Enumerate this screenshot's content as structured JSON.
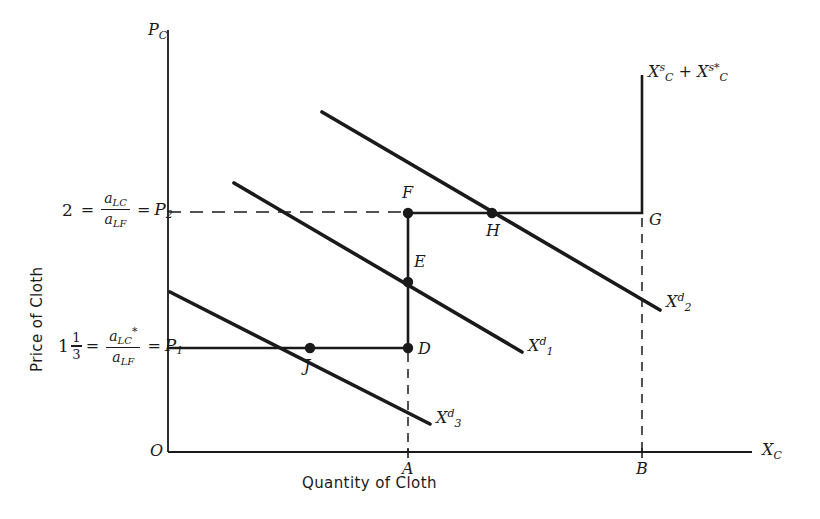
{
  "figure": {
    "background": "#ffffff",
    "ink": "#1a1a1a",
    "width": 820,
    "height": 519
  },
  "axes": {
    "x_axis_title": "Quantity of Cloth",
    "y_axis_title": "Price of Cloth",
    "x_axis_symbol": "X",
    "x_axis_symbol_sub": "C",
    "y_axis_symbol": "P",
    "y_axis_symbol_sub": "C",
    "origin_label": "O",
    "x_ticks": [
      {
        "label": "A",
        "x": 408
      },
      {
        "label": "B",
        "x": 642
      }
    ]
  },
  "price_levels": [
    {
      "id": "P2",
      "value_text": "2",
      "numerator": "a",
      "numerator_sub": "LC",
      "numerator_star": "",
      "denominator": "a",
      "denominator_sub": "LF",
      "price_symbol": "P",
      "price_sub": "2",
      "y": 212
    },
    {
      "id": "P1",
      "value_whole": "1",
      "value_num": "1",
      "value_den": "3",
      "numerator": "a",
      "numerator_sub": "LC",
      "numerator_star": "*",
      "denominator": "a",
      "denominator_sub": "LF",
      "price_symbol": "P",
      "price_sub": "1",
      "y": 348
    }
  ],
  "curves": {
    "supply": {
      "name": "world-supply-curve",
      "symbol_1": "X",
      "symbol_1_sub": "C",
      "symbol_1_sup": "s",
      "plus": "+",
      "symbol_2": "X",
      "symbol_2_sub": "C",
      "symbol_2_sup": "s*",
      "label_x": 648,
      "label_y": 70,
      "points": "168,348 408,348 408,213 642,213 642,75"
    },
    "demand": [
      {
        "id": "X2d",
        "symbol": "X",
        "sub": "2",
        "sup": "d",
        "x1": 322,
        "y1": 112,
        "x2": 660,
        "y2": 310,
        "label_x": 666,
        "label_y": 300
      },
      {
        "id": "X1d",
        "symbol": "X",
        "sub": "1",
        "sup": "d",
        "x1": 234,
        "y1": 183,
        "x2": 522,
        "y2": 352,
        "label_x": 528,
        "label_y": 344
      },
      {
        "id": "X3d",
        "symbol": "X",
        "sub": "3",
        "sup": "d",
        "x1": 170,
        "y1": 292,
        "x2": 430,
        "y2": 424,
        "label_x": 436,
        "label_y": 416
      }
    ]
  },
  "points": [
    {
      "label": "F",
      "x": 408,
      "y": 213,
      "label_dx": -4,
      "label_dy": -26
    },
    {
      "label": "H",
      "x": 492,
      "y": 213,
      "label_dx": -4,
      "label_dy": 12
    },
    {
      "label": "E",
      "x": 408,
      "y": 282,
      "label_dx": 8,
      "label_dy": -26
    },
    {
      "label": "D",
      "x": 408,
      "y": 348,
      "label_dx": 8,
      "label_dy": -4
    },
    {
      "label": "G",
      "x": 642,
      "y": 213,
      "label_dx": 7,
      "label_dy": 1
    },
    {
      "label": "J",
      "x": 310,
      "y": 348,
      "label_dx": -4,
      "label_dy": 14
    }
  ],
  "dashed_guides": [
    {
      "name": "p2-guide",
      "x1": 168,
      "y1": 212,
      "x2": 408,
      "y2": 212
    },
    {
      "name": "a-guide",
      "x1": 408,
      "y1": 353,
      "x2": 408,
      "y2": 452
    },
    {
      "name": "b-guide",
      "x1": 642,
      "y1": 218,
      "x2": 642,
      "y2": 452
    }
  ]
}
